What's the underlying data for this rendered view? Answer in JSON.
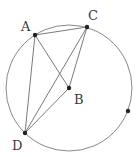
{
  "diagram": {
    "type": "circle-geometry",
    "circle": {
      "cx": 69,
      "cy": 88,
      "r": 63,
      "stroke": "#888888"
    },
    "points": [
      {
        "id": "A",
        "label": "A",
        "x": 35,
        "y": 35,
        "label_x": 21,
        "label_y": 31
      },
      {
        "id": "C",
        "label": "C",
        "x": 87,
        "y": 27,
        "label_x": 88,
        "label_y": 20
      },
      {
        "id": "B",
        "label": "B",
        "x": 69,
        "y": 88,
        "label_x": 74,
        "label_y": 104
      },
      {
        "id": "D",
        "label": "D",
        "x": 25,
        "y": 133,
        "label_x": 12,
        "label_y": 150
      },
      {
        "id": "E",
        "label": "",
        "x": 128,
        "y": 111,
        "label_x": 0,
        "label_y": 0
      }
    ],
    "segments": [
      [
        "A",
        "C"
      ],
      [
        "A",
        "D"
      ],
      [
        "A",
        "B"
      ],
      [
        "C",
        "D"
      ],
      [
        "C",
        "B"
      ],
      [
        "D",
        "B"
      ]
    ],
    "line_color": "#7a7a7a",
    "point_color": "#222222"
  }
}
